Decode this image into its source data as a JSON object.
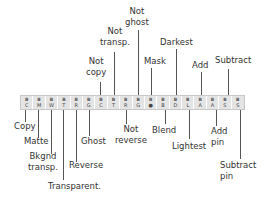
{
  "strip": {
    "cells": [
      {
        "top": "B",
        "bot": "C"
      },
      {
        "top": "B",
        "bot": "M"
      },
      {
        "top": "B",
        "bot": "W"
      },
      {
        "top": "B",
        "bot": "T"
      },
      {
        "top": "B",
        "bot": "R"
      },
      {
        "top": "B",
        "bot": "G"
      },
      {
        "top": "B",
        "bot": "C"
      },
      {
        "top": "B",
        "bot": "T"
      },
      {
        "top": "B",
        "bot": "R"
      },
      {
        "top": "B",
        "bot": "G"
      },
      {
        "top": "B",
        "bot": "●"
      },
      {
        "top": "B",
        "bot": "B"
      },
      {
        "top": "B",
        "bot": "D"
      },
      {
        "top": "B",
        "bot": "L"
      },
      {
        "top": "B",
        "bot": "A"
      },
      {
        "top": "B",
        "bot": "A"
      },
      {
        "top": "B",
        "bot": "S"
      },
      {
        "top": "B",
        "bot": "S"
      }
    ]
  },
  "labels_above": {
    "not_copy": "Not\ncopy",
    "not_transp": "Not\ntransp.",
    "not_ghost": "Not\nghost",
    "mask": "Mask",
    "darkest": "Darkest",
    "add": "Add",
    "subtract": "Subtract"
  },
  "labels_below": {
    "copy": "Copy",
    "matte": "Matte",
    "bkgnd_transp": "Bkgnd\ntransp.",
    "transparent": "Transparent.",
    "reverse": "Reverse",
    "ghost": "Ghost",
    "not_reverse": "Not\nreverse",
    "blend": "Blend",
    "lightest": "Lightest",
    "add_pin": "Add\npin",
    "subtract_pin": "Subtract\npin"
  }
}
